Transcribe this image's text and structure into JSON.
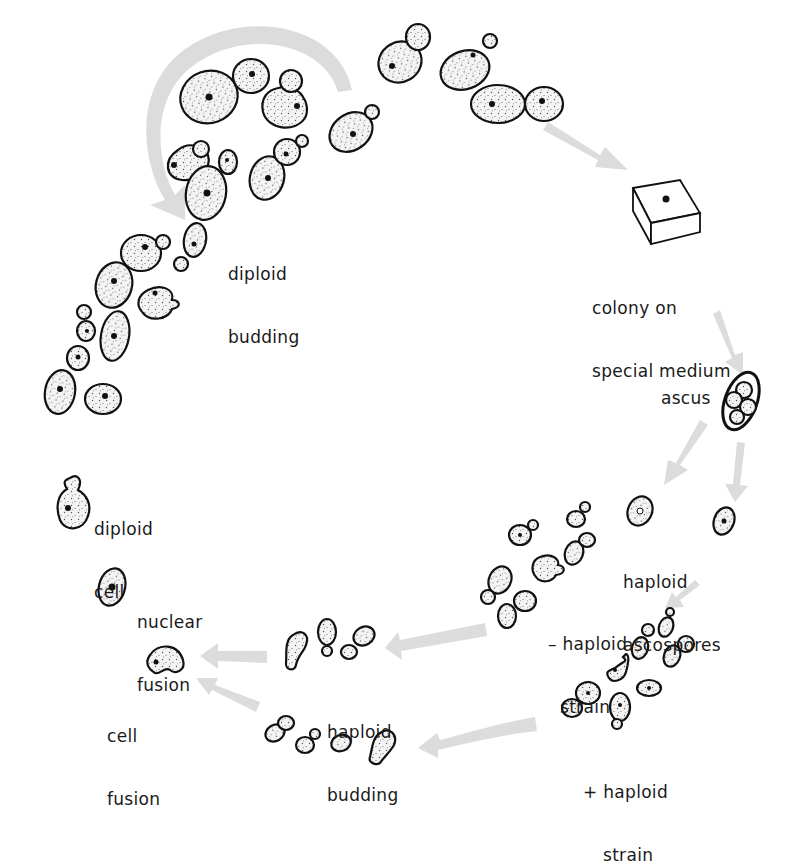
{
  "labels": {
    "diploid_budding": [
      "diploid",
      "budding"
    ],
    "colony": [
      "colony on",
      "special medium"
    ],
    "ascus": "ascus",
    "haploid_ascospores": [
      "haploid",
      "ascospores"
    ],
    "minus_strain": [
      "– haploid",
      "strain"
    ],
    "plus_strain": [
      "+ haploid",
      "strain"
    ],
    "haploid_budding": [
      "haploid",
      "budding"
    ],
    "cell_fusion": [
      "cell",
      "fusion"
    ],
    "nuclear_fusion": [
      "nuclear",
      "fusion"
    ],
    "diploid_cell": [
      "diploid",
      "cell"
    ]
  },
  "stages": [
    {
      "id": "diploid-budding",
      "name": "diploid budding"
    },
    {
      "id": "colony",
      "name": "colony on special medium"
    },
    {
      "id": "ascus",
      "name": "ascus"
    },
    {
      "id": "haploid-ascospores",
      "name": "haploid ascospores"
    },
    {
      "id": "minus-haploid-strain",
      "name": "– haploid strain"
    },
    {
      "id": "plus-haploid-strain",
      "name": "+ haploid strain"
    },
    {
      "id": "haploid-budding",
      "name": "haploid budding"
    },
    {
      "id": "cell-fusion",
      "name": "cell fusion"
    },
    {
      "id": "nuclear-fusion",
      "name": "nuclear fusion"
    },
    {
      "id": "diploid-cell",
      "name": "diploid cell"
    }
  ],
  "colors": {
    "ink": "#111111",
    "arrow": "#dcdcdc",
    "background": "#ffffff"
  }
}
